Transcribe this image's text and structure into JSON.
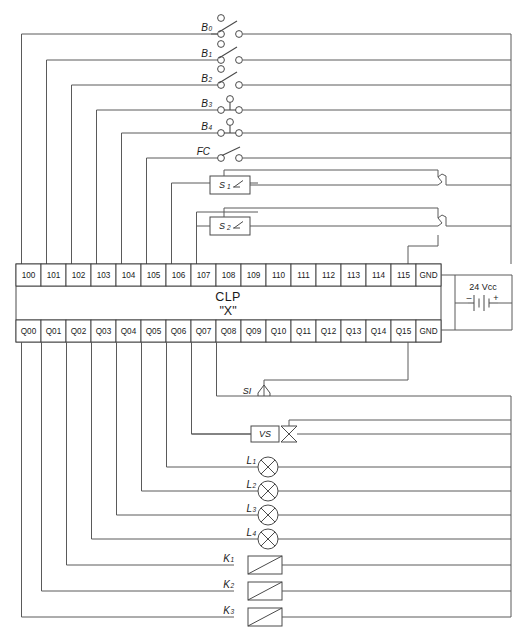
{
  "diagram": {
    "controller": {
      "line1": "CLP",
      "line2": "\"X\""
    },
    "power_supply": {
      "label": "24 Vcc",
      "negative": "–",
      "positive": "+"
    },
    "input_terminals": [
      "100",
      "101",
      "102",
      "103",
      "104",
      "105",
      "106",
      "107",
      "108",
      "109",
      "110",
      "111",
      "112",
      "113",
      "114",
      "115",
      "GND"
    ],
    "output_terminals": [
      "Q00",
      "Q01",
      "Q02",
      "Q03",
      "Q04",
      "Q05",
      "Q06",
      "Q07",
      "Q08",
      "Q09",
      "Q10",
      "Q11",
      "Q12",
      "Q13",
      "Q14",
      "Q15",
      "GND"
    ],
    "input_devices": [
      {
        "label": "B",
        "sub": "0",
        "type": "changeover-switch",
        "terminal": "100"
      },
      {
        "label": "B",
        "sub": "1",
        "type": "changeover-switch",
        "terminal": "101"
      },
      {
        "label": "B",
        "sub": "2",
        "type": "changeover-switch",
        "terminal": "102"
      },
      {
        "label": "B",
        "sub": "3",
        "type": "three-terminal-switch",
        "terminal": "103"
      },
      {
        "label": "B",
        "sub": "4",
        "type": "three-terminal-switch",
        "terminal": "104"
      },
      {
        "label": "FC",
        "sub": "",
        "type": "limit-switch",
        "terminal": "105"
      },
      {
        "label": "S",
        "sub": "1",
        "type": "sensor-box",
        "terminal": "106"
      },
      {
        "label": "S",
        "sub": "2",
        "type": "sensor-box",
        "terminal": "107"
      }
    ],
    "output_devices": [
      {
        "label": "SI",
        "sub": "",
        "type": "siren",
        "terminal": "Q08"
      },
      {
        "label": "VS",
        "sub": "",
        "type": "solenoid-valve",
        "terminal": "Q07"
      },
      {
        "label": "L",
        "sub": "1",
        "type": "lamp",
        "terminal": "Q06"
      },
      {
        "label": "L",
        "sub": "2",
        "type": "lamp",
        "terminal": "Q05"
      },
      {
        "label": "L",
        "sub": "3",
        "type": "lamp",
        "terminal": "Q04"
      },
      {
        "label": "L",
        "sub": "4",
        "type": "lamp",
        "terminal": "Q03"
      },
      {
        "label": "K",
        "sub": "1",
        "type": "relay-coil",
        "terminal": "Q02"
      },
      {
        "label": "K",
        "sub": "2",
        "type": "relay-coil",
        "terminal": "Q01"
      },
      {
        "label": "K",
        "sub": "3",
        "type": "relay-coil",
        "terminal": "Q00"
      }
    ],
    "colors": {
      "wire": "#5a5a5a",
      "outline": "#4a4a4a",
      "text": "#1a1a1a",
      "background": "#ffffff"
    }
  }
}
